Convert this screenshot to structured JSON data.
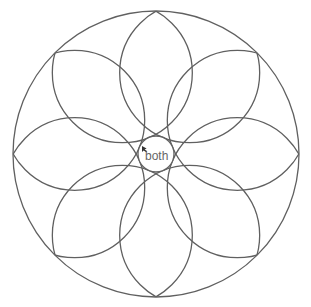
{
  "diagram": {
    "type": "rosette",
    "center_label": "both",
    "outer_circle": {
      "cx": 156,
      "cy": 154,
      "r": 143
    },
    "center_circle": {
      "cx": 156,
      "cy": 154,
      "r": 18
    },
    "petal_circles": {
      "count": 8,
      "ring_distance": 88,
      "radius": 70,
      "start_angle_deg": 22.5
    },
    "stroke_color": "#606060",
    "label_color": "#666666"
  }
}
